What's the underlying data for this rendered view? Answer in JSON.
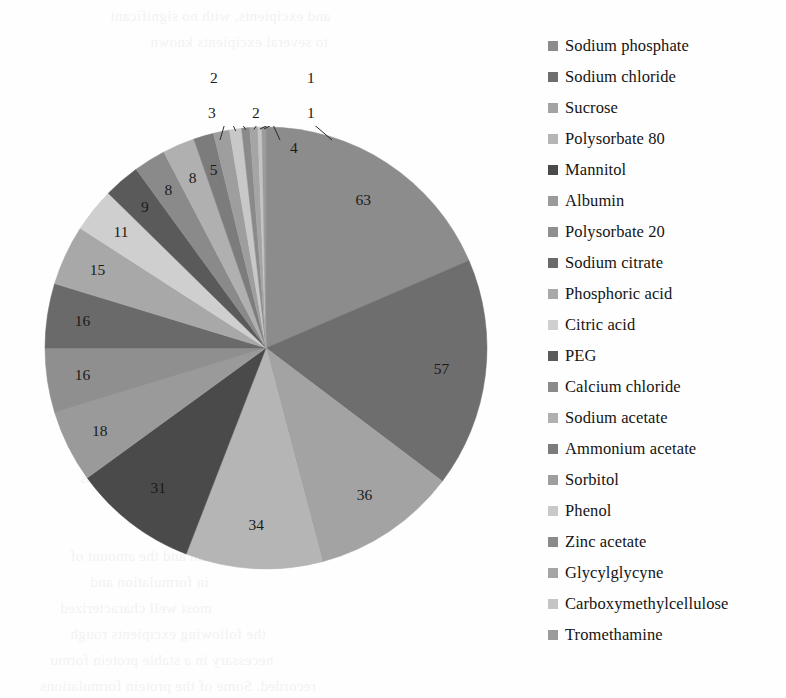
{
  "chart_data": {
    "type": "pie",
    "title": "",
    "subtitle": "",
    "xlabel": "",
    "ylabel": "",
    "legend_position": "right",
    "grid": false,
    "start_angle_deg": 0,
    "direction": "clockwise",
    "total": 356,
    "categories": [
      "Sodium phosphate",
      "Sodium chloride",
      "Sucrose",
      "Polysorbate 80",
      "Mannitol",
      "Albumin",
      "Polysorbate 20",
      "Sodium citrate",
      "Phosphoric acid",
      "Citric acid",
      "PEG",
      "Calcium chloride",
      "Sodium acetate",
      "Ammonium acetate",
      "Sorbitol",
      "Phenol",
      "Zinc acetate",
      "Glycylglycyne",
      "Carboxymethylcellulose",
      "Tromethamine"
    ],
    "values": [
      63,
      57,
      36,
      34,
      31,
      18,
      16,
      16,
      15,
      11,
      9,
      8,
      8,
      5,
      4,
      3,
      2,
      2,
      1,
      1
    ],
    "colors": [
      "#8c8c8c",
      "#6e6e6e",
      "#a3a3a3",
      "#b5b5b5",
      "#4a4a4a",
      "#9a9a9a",
      "#8f8f8f",
      "#6a6a6a",
      "#a8a8a8",
      "#cfcfcf",
      "#5a5a5a",
      "#8a8a8a",
      "#b0b0b0",
      "#7c7c7c",
      "#9e9e9e",
      "#c8c8c8",
      "#8a8a8a",
      "#a5a5a5",
      "#c4c4c4",
      "#9b9b9b"
    ],
    "data_labels": [
      "63",
      "57",
      "36",
      "34",
      "31",
      "18",
      "16",
      "16",
      "15",
      "11",
      "9",
      "8",
      "8",
      "5",
      "4",
      "3",
      "2",
      "2",
      "1",
      "1"
    ],
    "callout_labels": [
      "4",
      "3",
      "2",
      "2",
      "1",
      "1"
    ]
  },
  "legend": {
    "items": [
      {
        "label": "Sodium phosphate",
        "color": "#8c8c8c"
      },
      {
        "label": "Sodium chloride",
        "color": "#6e6e6e"
      },
      {
        "label": "Sucrose",
        "color": "#a3a3a3"
      },
      {
        "label": "Polysorbate 80",
        "color": "#b5b5b5"
      },
      {
        "label": "Mannitol",
        "color": "#4a4a4a"
      },
      {
        "label": "Albumin",
        "color": "#9a9a9a"
      },
      {
        "label": "Polysorbate 20",
        "color": "#8f8f8f"
      },
      {
        "label": "Sodium citrate",
        "color": "#6a6a6a"
      },
      {
        "label": "Phosphoric acid",
        "color": "#a8a8a8"
      },
      {
        "label": "Citric acid",
        "color": "#cfcfcf"
      },
      {
        "label": "PEG",
        "color": "#5a5a5a"
      },
      {
        "label": "Calcium chloride",
        "color": "#8a8a8a"
      },
      {
        "label": "Sodium acetate",
        "color": "#b0b0b0"
      },
      {
        "label": "Ammonium acetate",
        "color": "#7c7c7c"
      },
      {
        "label": "Sorbitol",
        "color": "#9e9e9e"
      },
      {
        "label": "Phenol",
        "color": "#c8c8c8"
      },
      {
        "label": "Zinc acetate",
        "color": "#8a8a8a"
      },
      {
        "label": "Glycylglycyne",
        "color": "#a5a5a5"
      },
      {
        "label": "Carboxymethylcellulose",
        "color": "#c4c4c4"
      },
      {
        "label": "Tromethamine",
        "color": "#9b9b9b"
      }
    ]
  },
  "background_text": {
    "lines": [
      "and excipients, with no significant",
      "to several excipients known",
      "manufacturing process",
      "tration and the amount of",
      "in formulation and",
      "most well characterized",
      "the following excipients rough",
      "necessary in a stable protein formu",
      "recorded. Some of the protein formulations"
    ]
  }
}
